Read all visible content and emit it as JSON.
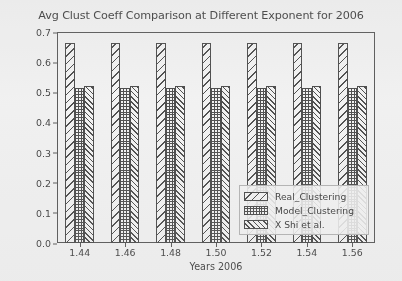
{
  "chart_data": {
    "type": "bar",
    "title": "Avg Clust Coeff Comparison at Different Exponent for 2006",
    "xlabel": "Years 2006",
    "ylabel": "Avg Clust Coeff",
    "categories": [
      "1.44",
      "1.46",
      "1.48",
      "1.50",
      "1.52",
      "1.54",
      "1.56"
    ],
    "series": [
      {
        "name": "Real_Clustering",
        "hatch": "diag-sparse",
        "values": [
          0.665,
          0.665,
          0.665,
          0.665,
          0.665,
          0.665,
          0.665
        ]
      },
      {
        "name": "Model_Clustering",
        "hatch": "cross-dense",
        "values": [
          0.515,
          0.515,
          0.515,
          0.515,
          0.515,
          0.515,
          0.515
        ]
      },
      {
        "name": "X Shi et al.",
        "hatch": "diag-dense",
        "values": [
          0.52,
          0.52,
          0.52,
          0.52,
          0.52,
          0.52,
          0.52
        ]
      }
    ],
    "ylim": [
      0.0,
      0.7
    ],
    "yticks": [
      "0.0",
      "0.1",
      "0.2",
      "0.3",
      "0.4",
      "0.5",
      "0.6",
      "0.7"
    ],
    "ytick_values": [
      0.0,
      0.1,
      0.2,
      0.3,
      0.4,
      0.5,
      0.6,
      0.7
    ],
    "grid": false,
    "legend_position": "lower right",
    "colors": {
      "bar_edge": "#3a3a3a",
      "hatch": "#3d3d3d",
      "bar_face": "#ffffff",
      "axis": "#4a4a4a",
      "text": "#2c2c2c",
      "background": "#fdfdfd"
    }
  }
}
